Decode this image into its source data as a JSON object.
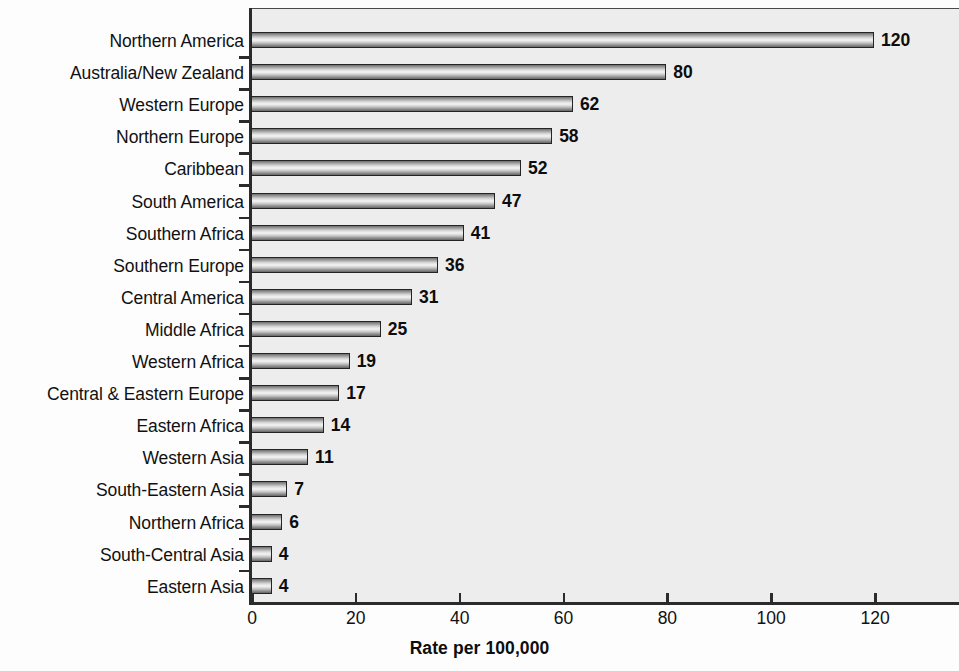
{
  "chart_data": {
    "type": "bar",
    "orientation": "horizontal",
    "title": "",
    "subtitle": "",
    "xlabel": "Rate per 100,000",
    "ylabel": "",
    "xlim": [
      0,
      136
    ],
    "ylim": null,
    "xticks": [
      0,
      20,
      40,
      60,
      80,
      100,
      120
    ],
    "xtick_labels": [
      "0",
      "20",
      "40",
      "60",
      "80",
      "100",
      "120"
    ],
    "grid": false,
    "legend": null,
    "categories": [
      "Northern America",
      "Australia/New Zealand",
      "Western Europe",
      "Northern Europe",
      "Caribbean",
      "South America",
      "Southern Africa",
      "Southern Europe",
      "Central America",
      "Middle Africa",
      "Western Africa",
      "Central & Eastern Europe",
      "Eastern Africa",
      "Western Asia",
      "South-Eastern Asia",
      "Northern Africa",
      "South-Central Asia",
      "Eastern Asia"
    ],
    "values": [
      120,
      80,
      62,
      58,
      52,
      47,
      41,
      36,
      31,
      25,
      19,
      17,
      14,
      11,
      7,
      6,
      4,
      4
    ],
    "value_labels": [
      "120",
      "80",
      "62",
      "58",
      "52",
      "47",
      "41",
      "36",
      "31",
      "25",
      "19",
      "17",
      "14",
      "11",
      "7",
      "6",
      "4",
      "4"
    ],
    "colors": {
      "plot_background": "#ededed",
      "page_background": "#fdfdfd",
      "axis": "#2b2b2b",
      "bar_border": "#242424",
      "bar_fill_light": "#f4f4f4",
      "bar_fill_dark": "#656565",
      "text": "#111111"
    }
  }
}
